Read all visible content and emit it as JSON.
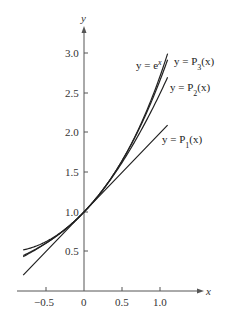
{
  "chart_data": {
    "type": "line",
    "title": "",
    "xlabel": "x",
    "ylabel": "y",
    "xlim": [
      -0.8,
      1.15
    ],
    "ylim": [
      0,
      3.3
    ],
    "grid": false,
    "x_ticks": [
      -0.5,
      0,
      0.5,
      1.0
    ],
    "x_tick_labels": [
      "−0.5",
      "0",
      "0.5",
      "1.0"
    ],
    "y_ticks": [
      0.5,
      1.0,
      1.5,
      2.0,
      2.5,
      3.0
    ],
    "y_tick_labels": [
      "0.5",
      "1.0",
      "1.5",
      "2.0",
      "2.5",
      "3.0"
    ],
    "series": [
      {
        "name": "y = e^x",
        "label": "y = eˣ",
        "formula": "exp(x)",
        "x_range": [
          -0.8,
          1.1
        ]
      },
      {
        "name": "y = P3(x)",
        "label": "y = P₃(x)",
        "formula": "1 + x + x^2/2 + x^3/6",
        "x_range": [
          -0.8,
          1.1
        ]
      },
      {
        "name": "y = P2(x)",
        "label": "y = P₂(x)",
        "formula": "1 + x + x^2/2",
        "x_range": [
          -0.8,
          1.1
        ]
      },
      {
        "name": "y = P1(x)",
        "label": "y = P₁(x)",
        "formula": "1 + x",
        "x_range": [
          -0.8,
          1.1
        ]
      }
    ],
    "annotations": [
      {
        "text": "y = eˣ",
        "near_series": "y = e^x"
      },
      {
        "text": "y = P₃(x)",
        "near_series": "y = P3(x)"
      },
      {
        "text": "y = P₂(x)",
        "near_series": "y = P2(x)"
      },
      {
        "text": "y = P₁(x)",
        "near_series": "y = P1(x)"
      }
    ]
  },
  "labels": {
    "x_axis": "x",
    "y_axis": "y",
    "ex": "y = e",
    "ex_sup": "x",
    "p3": "y = P",
    "p3_sub": "3",
    "p3_tail": "(x)",
    "p2": "y = P",
    "p2_sub": "2",
    "p2_tail": "(x)",
    "p1": "y = P",
    "p1_sub": "1",
    "p1_tail": "(x)",
    "xt0": "−0.5",
    "xt1": "0",
    "xt2": "0.5",
    "xt3": "1.0",
    "yt0": "0.5",
    "yt1": "1.0",
    "yt2": "1.5",
    "yt3": "2.0",
    "yt4": "2.5",
    "yt5": "3.0"
  },
  "colors": {
    "curve": "#222222",
    "axis": "#555555"
  }
}
